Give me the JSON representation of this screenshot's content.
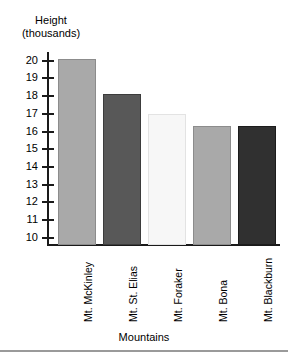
{
  "chart_data": {
    "type": "bar",
    "title": "",
    "categories": [
      "Mt. McKinley",
      "Mt. St. Elias",
      "Mt. Foraker",
      "Mt. Bona",
      "Mt. Blackburn"
    ],
    "values": [
      20.1,
      18.1,
      17.0,
      16.3,
      16.3
    ],
    "xlabel": "Mountains",
    "ylabel": "Height (thousands)",
    "ylabel_line1": "Height",
    "ylabel_line2": "(thousands)",
    "ylim": [
      9.6,
      20.6
    ],
    "ytick_labels": [
      "20",
      "19",
      "18",
      "17",
      "16",
      "15",
      "14",
      "13",
      "12",
      "11",
      "10"
    ],
    "ytick_values": [
      20,
      19,
      18,
      17,
      16,
      15,
      14,
      13,
      12,
      11,
      10
    ],
    "grid": false,
    "legend": "none",
    "series": [
      {
        "name": "Height (thousands of feet)",
        "values": [
          20.1,
          18.1,
          17.0,
          16.3,
          16.3
        ]
      }
    ],
    "bars": [
      {
        "label": "Mt. McKinley",
        "value": 20.1,
        "fill": "#a9a9a9",
        "border": "#8c8c8c"
      },
      {
        "label": "Mt. St. Elias",
        "value": 18.1,
        "fill": "#585858",
        "border": "#3c3c3c"
      },
      {
        "label": "Mt. Foraker",
        "value": 17.0,
        "fill": "#f7f7f7",
        "border": "#e3e3e3"
      },
      {
        "label": "Mt. Bona",
        "value": 16.3,
        "fill": "#a9a9a9",
        "border": "#8c8c8c"
      },
      {
        "label": "Mt. Blackburn",
        "value": 16.3,
        "fill": "#303030",
        "border": "#1c1c1c"
      }
    ],
    "axis_color": "#1a1a1a",
    "background": "#ffffff"
  }
}
